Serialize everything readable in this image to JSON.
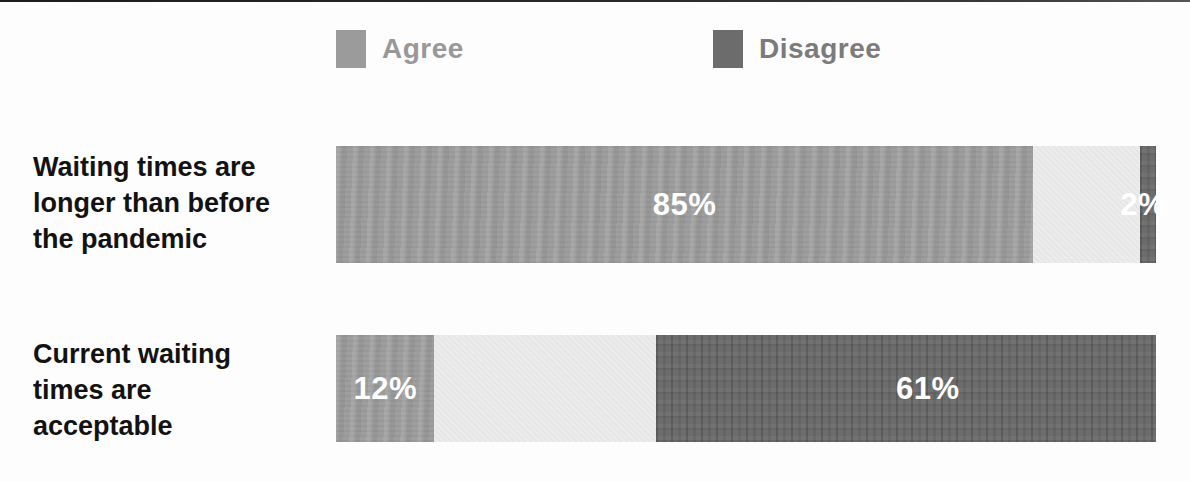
{
  "legend": {
    "agree_label": "Agree",
    "disagree_label": "Disagree"
  },
  "colors": {
    "agree": "#9b9b9b",
    "neutral": "#ececec",
    "disagree": "#6c6c6c",
    "bar_value_text": "#ffffff"
  },
  "chart_data": {
    "type": "bar",
    "orientation": "horizontal",
    "stacked": true,
    "title": "",
    "xlabel": "",
    "ylabel": "",
    "xlim": [
      0,
      100
    ],
    "value_unit": "%",
    "grid": false,
    "axes_visible": false,
    "legend_position": "top",
    "categories": [
      "Waiting times are\nlonger than before\nthe pandemic",
      "Current waiting\ntimes are\nacceptable"
    ],
    "series": [
      {
        "name": "Agree",
        "color": "#9b9b9b",
        "values": [
          85,
          12
        ],
        "labels": [
          "85%",
          "12%"
        ]
      },
      {
        "name": "",
        "color": "#ececec",
        "values": [
          13,
          27
        ],
        "labels": [
          "",
          ""
        ]
      },
      {
        "name": "Disagree",
        "color": "#6c6c6c",
        "values": [
          2,
          61
        ],
        "labels": [
          "2%",
          "61%"
        ]
      }
    ]
  }
}
